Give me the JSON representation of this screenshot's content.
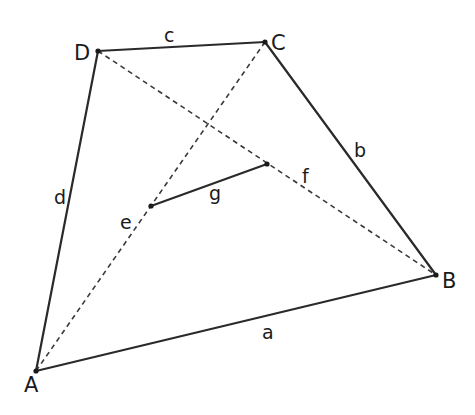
{
  "diagram": {
    "type": "quadrilateral-with-diagonals",
    "vertices": {
      "A": {
        "label": "A",
        "x": 36,
        "y": 371,
        "lx": 24,
        "ly": 392
      },
      "B": {
        "label": "B",
        "x": 436,
        "y": 275,
        "lx": 442,
        "ly": 288
      },
      "C": {
        "label": "C",
        "x": 265,
        "y": 42,
        "lx": 271,
        "ly": 50
      },
      "D": {
        "label": "D",
        "x": 98,
        "y": 51,
        "lx": 74,
        "ly": 60
      }
    },
    "sides": [
      {
        "name": "a",
        "label": "a",
        "from": "A",
        "to": "B",
        "style": "solid",
        "lx": 262,
        "ly": 339
      },
      {
        "name": "b",
        "label": "b",
        "from": "B",
        "to": "C",
        "style": "solid",
        "lx": 354,
        "ly": 157
      },
      {
        "name": "c",
        "label": "c",
        "from": "C",
        "to": "D",
        "style": "solid",
        "lx": 164,
        "ly": 42
      },
      {
        "name": "d",
        "label": "d",
        "from": "D",
        "to": "A",
        "style": "solid",
        "lx": 54,
        "ly": 204
      }
    ],
    "diagonals": [
      {
        "name": "e",
        "label": "e",
        "from": "A",
        "to": "C",
        "style": "dashed",
        "lx": 120,
        "ly": 229
      },
      {
        "name": "f",
        "label": "f",
        "from": "D",
        "to": "B",
        "style": "dashed",
        "lx": 302,
        "ly": 183
      }
    ],
    "midpoints": {
      "M_e": {
        "x": 151,
        "y": 206
      },
      "M_f": {
        "x": 267,
        "y": 164
      }
    },
    "segment_g": {
      "label": "g",
      "from": "M_e",
      "to": "M_f",
      "style": "solid",
      "lx": 209,
      "ly": 200
    }
  }
}
